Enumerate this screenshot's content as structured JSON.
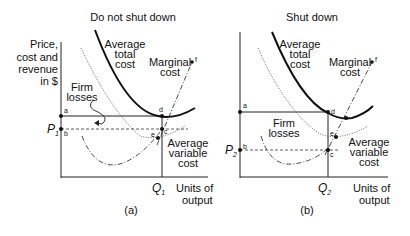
{
  "panels": [
    {
      "id": "a",
      "title": "Do not shut down",
      "caption": "(a)",
      "y_axis_label": [
        "Price,",
        "cost and",
        "revenue",
        "in $"
      ],
      "x_axis_label": [
        "Units of",
        "output"
      ],
      "price_label": "P",
      "price_sub": "1",
      "quantity_label": "Q",
      "quantity_sub": "1",
      "curves": {
        "atc": [
          "Average",
          "total",
          "cost"
        ],
        "mc": [
          "Marginal",
          "cost"
        ],
        "avc": [
          "Average",
          "variable",
          "cost"
        ]
      },
      "area_label": [
        "Firm",
        "losses"
      ],
      "points": [
        "a",
        "b",
        "c",
        "d",
        "e",
        "f"
      ]
    },
    {
      "id": "b",
      "title": "Shut down",
      "caption": "(b)",
      "x_axis_label": [
        "Units of",
        "output"
      ],
      "price_label": "P",
      "price_sub": "2",
      "quantity_label": "Q",
      "quantity_sub": "2",
      "curves": {
        "atc": [
          "Average",
          "total",
          "cost"
        ],
        "mc": [
          "Marginal",
          "cost"
        ],
        "avc": [
          "Average",
          "variable",
          "cost"
        ]
      },
      "area_label": [
        "Firm",
        "losses"
      ],
      "points": [
        "a",
        "b",
        "c",
        "d",
        "e",
        "f"
      ]
    }
  ]
}
